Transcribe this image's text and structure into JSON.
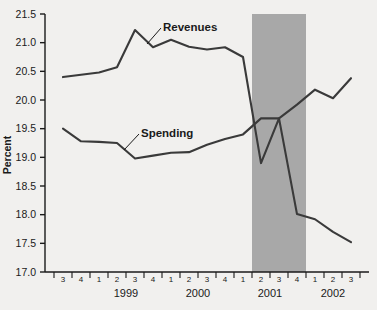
{
  "chart_data": {
    "type": "line",
    "title": "",
    "xlabel": "",
    "ylabel": "Percent",
    "ylim": [
      17.0,
      21.5
    ],
    "ytick_labels": [
      "21.5",
      "21.0",
      "20.5",
      "20.0",
      "19.5",
      "19.0",
      "18.5",
      "18.0",
      "17.5",
      "17.0"
    ],
    "ytick_values": [
      21.5,
      21.0,
      20.5,
      20.0,
      19.5,
      19.0,
      18.5,
      18.0,
      17.5,
      17.0
    ],
    "grid": false,
    "legend_position": "inline-annotation",
    "x": [
      "3",
      "4",
      "1",
      "2",
      "3",
      "4",
      "1",
      "2",
      "3",
      "4",
      "1",
      "2",
      "3",
      "4",
      "1",
      "2",
      "3"
    ],
    "quarter_labels": [
      "3",
      "4",
      "1",
      "2",
      "3",
      "4",
      "1",
      "2",
      "3",
      "4",
      "1",
      "2",
      "3",
      "4",
      "1",
      "2",
      "3"
    ],
    "year_groups": [
      {
        "label": "1999",
        "start_index": 2,
        "end_index": 5
      },
      {
        "label": "2000",
        "start_index": 6,
        "end_index": 9
      },
      {
        "label": "2001",
        "start_index": 10,
        "end_index": 13
      },
      {
        "label": "2002",
        "start_index": 14,
        "end_index": 16
      }
    ],
    "series": [
      {
        "name": "Revenues",
        "color": "#3a3a3a",
        "values": [
          20.4,
          20.44,
          20.48,
          20.57,
          21.22,
          20.92,
          21.05,
          20.93,
          20.88,
          20.92,
          20.75,
          18.9,
          19.68,
          18.01,
          17.92,
          17.7,
          17.52
        ]
      },
      {
        "name": "Spending",
        "color": "#3a3a3a",
        "values": [
          19.5,
          19.28,
          19.27,
          19.25,
          18.98,
          19.03,
          19.08,
          19.09,
          19.22,
          19.32,
          19.4,
          19.68,
          19.68,
          19.92,
          20.18,
          20.03,
          20.38
        ]
      }
    ],
    "annotations": [
      {
        "name": "Revenues",
        "text": "Revenues",
        "leader": true
      },
      {
        "name": "Spending",
        "text": "Spending",
        "leader": true
      }
    ],
    "shaded_regions": [
      {
        "name": "recession-band",
        "color": "#a8a8a8",
        "start_index": 11,
        "end_index": 13,
        "label": ""
      }
    ],
    "colors": {
      "background": "#f1f0ee",
      "line": "#3a3a3a",
      "axis": "#1a1a1a",
      "shade": "#a8a8a8"
    }
  }
}
